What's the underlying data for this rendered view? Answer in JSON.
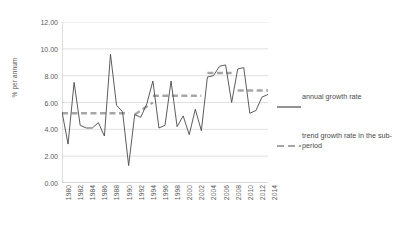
{
  "chart_data": {
    "type": "line",
    "title": "",
    "xlabel": "",
    "ylabel": "% per annum",
    "ylim": [
      0,
      12
    ],
    "ytick_step": 2,
    "ytick_labels": [
      "0.00",
      "2.00",
      "4.00",
      "6.00",
      "8.00",
      "10.00",
      "12.00"
    ],
    "ytick_values": [
      0,
      2,
      4,
      6,
      8,
      10,
      12
    ],
    "grid": "horizontal",
    "legend_position": "right",
    "xlim": [
      1980,
      2014
    ],
    "xtick_labels": [
      "1980",
      "1982",
      "1984",
      "1986",
      "1988",
      "1990",
      "1992",
      "1994",
      "1996",
      "1998",
      "2000",
      "2002",
      "2004",
      "2006",
      "2008",
      "2010",
      "2012",
      "2014"
    ],
    "x": [
      1980,
      1981,
      1982,
      1983,
      1984,
      1985,
      1986,
      1987,
      1988,
      1989,
      1990,
      1991,
      1992,
      1993,
      1994,
      1995,
      1996,
      1997,
      1998,
      1999,
      2000,
      2001,
      2002,
      2003,
      2004,
      2005,
      2006,
      2007,
      2008,
      2009,
      2010,
      2011,
      2012,
      2013,
      2014
    ],
    "series": [
      {
        "name": "annual growth rate",
        "color": "#4a4a4a",
        "style": "solid",
        "values": [
          5.3,
          2.9,
          7.5,
          4.3,
          4.1,
          4.1,
          4.5,
          3.5,
          9.6,
          5.8,
          5.3,
          1.3,
          5.1,
          4.9,
          5.9,
          7.6,
          4.1,
          4.3,
          7.6,
          4.2,
          5.0,
          3.6,
          5.5,
          3.9,
          7.9,
          8.0,
          8.7,
          8.8,
          6.0,
          8.5,
          8.6,
          5.2,
          5.4,
          6.4,
          6.6
        ]
      },
      {
        "name": "trend growth rate in the sub-period",
        "color": "#a6a6a6",
        "style": "dashed",
        "segments": [
          {
            "x_start": 1980,
            "x_end": 1991,
            "y_start": 5.2,
            "y_end": 5.2
          },
          {
            "x_start": 1992,
            "x_end": 1995,
            "y_start": 5.1,
            "y_end": 6.0
          },
          {
            "x_start": 1995,
            "x_end": 2003,
            "y_start": 6.5,
            "y_end": 6.5
          },
          {
            "x_start": 2004,
            "x_end": 2008,
            "y_start": 8.2,
            "y_end": 8.2
          },
          {
            "x_start": 2009,
            "x_end": 2014,
            "y_start": 6.9,
            "y_end": 6.9
          }
        ]
      }
    ],
    "legend": [
      {
        "label": "annual growth rate",
        "style": "solid",
        "color": "#4a4a4a"
      },
      {
        "label": "trend growth rate in the sub-period",
        "style": "dashed",
        "color": "#a6a6a6"
      }
    ]
  }
}
